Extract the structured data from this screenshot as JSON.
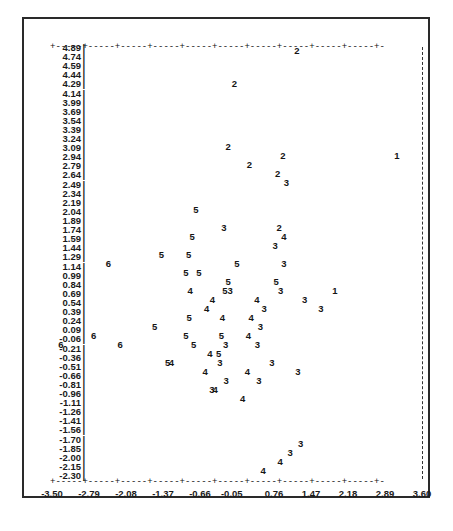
{
  "chart_data": {
    "type": "scatter",
    "title": "",
    "subtitle": "",
    "xlabel": "",
    "ylabel": "",
    "xlim": [
      -3.5,
      3.6
    ],
    "ylim": [
      -2.3,
      4.89
    ],
    "grid": false,
    "legend": "none",
    "marker_style": "cluster-number-glyph",
    "x_tick_labels": [
      "-3.50",
      "-2.79",
      "-2.08",
      "-1.37",
      "-0.66",
      "-0.05",
      "0.76",
      "1.47",
      "2.18",
      "2.89",
      "3.60"
    ],
    "x_tick_values": [
      -3.5,
      -2.79,
      -2.08,
      -1.37,
      -0.66,
      -0.05,
      0.76,
      1.47,
      2.18,
      2.89,
      3.6
    ],
    "y_tick_labels": [
      "4.89",
      "4.74",
      "4.59",
      "4.44",
      "4.29",
      "4.14",
      "3.99",
      "3.69",
      "3.54",
      "3.39",
      "3.24",
      "3.09",
      "2.94",
      "2.79",
      "2.64",
      "2.49",
      "2.34",
      "2.19",
      "2.04",
      "1.89",
      "1.74",
      "1.59",
      "1.44",
      "1.29",
      "1.14",
      "0.99",
      "0.84",
      "0.69",
      "0.54",
      "0.39",
      "0.24",
      "0.09",
      "-0.06",
      "-0.21",
      "-0.36",
      "-0.51",
      "-0.66",
      "-0.81",
      "-0.96",
      "-1.11",
      "-1.26",
      "-1.41",
      "-1.56",
      "-1.70",
      "-1.85",
      "-2.00",
      "-2.15",
      "-2.30"
    ],
    "y_tick_values": [
      4.89,
      4.74,
      4.59,
      4.44,
      4.29,
      4.14,
      3.99,
      3.69,
      3.54,
      3.39,
      3.24,
      3.09,
      2.94,
      2.79,
      2.64,
      2.49,
      2.34,
      2.19,
      2.04,
      1.89,
      1.74,
      1.59,
      1.44,
      1.29,
      1.14,
      0.99,
      0.84,
      0.69,
      0.54,
      0.39,
      0.24,
      0.09,
      -0.06,
      -0.21,
      -0.36,
      -0.51,
      -0.66,
      -0.81,
      -0.96,
      -1.11,
      -1.26,
      -1.41,
      -1.56,
      -1.7,
      -1.85,
      -2.0,
      -2.15,
      -2.3
    ],
    "groups": [
      "1",
      "2",
      "3",
      "4",
      "5",
      "6"
    ],
    "points": [
      {
        "label": "2",
        "x": 1.2,
        "y": 4.84
      },
      {
        "label": "2",
        "x": 0.0,
        "y": 4.29
      },
      {
        "label": "2",
        "x": -0.12,
        "y": 3.24
      },
      {
        "label": "2",
        "x": 0.29,
        "y": 2.94
      },
      {
        "label": "2",
        "x": 0.93,
        "y": 3.09
      },
      {
        "label": "2",
        "x": 0.83,
        "y": 2.79
      },
      {
        "label": "1",
        "x": 3.12,
        "y": 3.09
      },
      {
        "label": "3",
        "x": 1.0,
        "y": 2.64
      },
      {
        "label": "5",
        "x": -0.74,
        "y": 2.19
      },
      {
        "label": "3",
        "x": -0.2,
        "y": 1.89
      },
      {
        "label": "2",
        "x": 0.86,
        "y": 1.89
      },
      {
        "label": "5",
        "x": -0.81,
        "y": 1.74
      },
      {
        "label": "4",
        "x": 0.95,
        "y": 1.74
      },
      {
        "label": "3",
        "x": 0.78,
        "y": 1.59
      },
      {
        "label": "5",
        "x": -1.4,
        "y": 1.44
      },
      {
        "label": "5",
        "x": -0.88,
        "y": 1.44
      },
      {
        "label": "6",
        "x": -2.42,
        "y": 1.29
      },
      {
        "label": "5",
        "x": 0.05,
        "y": 1.29
      },
      {
        "label": "3",
        "x": 0.95,
        "y": 1.29
      },
      {
        "label": "5",
        "x": -0.93,
        "y": 1.14
      },
      {
        "label": "5",
        "x": -0.68,
        "y": 1.14
      },
      {
        "label": "5",
        "x": -0.12,
        "y": 0.99
      },
      {
        "label": "5",
        "x": 0.8,
        "y": 0.99
      },
      {
        "label": "4",
        "x": -0.85,
        "y": 0.84
      },
      {
        "label": "5",
        "x": -0.18,
        "y": 0.84
      },
      {
        "label": "3",
        "x": -0.08,
        "y": 0.84
      },
      {
        "label": "3",
        "x": 0.89,
        "y": 0.84
      },
      {
        "label": "1",
        "x": 1.93,
        "y": 0.84
      },
      {
        "label": "4",
        "x": -0.42,
        "y": 0.69
      },
      {
        "label": "4",
        "x": 0.43,
        "y": 0.69
      },
      {
        "label": "3",
        "x": 1.35,
        "y": 0.69
      },
      {
        "label": "4",
        "x": -0.53,
        "y": 0.54
      },
      {
        "label": "3",
        "x": 0.57,
        "y": 0.54
      },
      {
        "label": "3",
        "x": 1.66,
        "y": 0.54
      },
      {
        "label": "5",
        "x": -0.87,
        "y": 0.39
      },
      {
        "label": "4",
        "x": -0.23,
        "y": 0.39
      },
      {
        "label": "4",
        "x": 0.32,
        "y": 0.39
      },
      {
        "label": "5",
        "x": -1.53,
        "y": 0.24
      },
      {
        "label": "3",
        "x": 0.5,
        "y": 0.24
      },
      {
        "label": "6",
        "x": -2.7,
        "y": 0.09
      },
      {
        "label": "5",
        "x": -0.93,
        "y": 0.09
      },
      {
        "label": "5",
        "x": -0.25,
        "y": 0.09
      },
      {
        "label": "4",
        "x": 0.27,
        "y": 0.09
      },
      {
        "label": "6",
        "x": -3.33,
        "y": -0.06
      },
      {
        "label": "6",
        "x": -2.19,
        "y": -0.06
      },
      {
        "label": "5",
        "x": -0.78,
        "y": -0.06
      },
      {
        "label": "3",
        "x": -0.17,
        "y": -0.06
      },
      {
        "label": "3",
        "x": 0.44,
        "y": -0.06
      },
      {
        "label": "4",
        "x": -0.47,
        "y": -0.21
      },
      {
        "label": "5",
        "x": -0.3,
        "y": -0.21
      },
      {
        "label": "5",
        "x": -1.28,
        "y": -0.36
      },
      {
        "label": "4",
        "x": -1.21,
        "y": -0.36
      },
      {
        "label": "3",
        "x": -0.28,
        "y": -0.36
      },
      {
        "label": "3",
        "x": 0.72,
        "y": -0.36
      },
      {
        "label": "4",
        "x": -0.56,
        "y": -0.51
      },
      {
        "label": "4",
        "x": 0.25,
        "y": -0.51
      },
      {
        "label": "3",
        "x": 1.22,
        "y": -0.51
      },
      {
        "label": "3",
        "x": -0.16,
        "y": -0.66
      },
      {
        "label": "3",
        "x": 0.47,
        "y": -0.66
      },
      {
        "label": "3",
        "x": -0.43,
        "y": -0.81
      },
      {
        "label": "4",
        "x": -0.37,
        "y": -0.81
      },
      {
        "label": "4",
        "x": 0.16,
        "y": -0.96
      },
      {
        "label": "3",
        "x": 1.27,
        "y": -1.7
      },
      {
        "label": "3",
        "x": 1.07,
        "y": -1.85
      },
      {
        "label": "4",
        "x": 0.88,
        "y": -2.0
      },
      {
        "label": "4",
        "x": 0.55,
        "y": -2.15
      }
    ]
  },
  "axes": {
    "top_axis_glyph": "+-----+-----+-----+-----+-----+-----+-----+-----+-----+-----+-",
    "bottom_axis_glyph": "+-----+-----+-----+-----+-----+-----+-----+-----+-----+-----+-",
    "y_axis_tick_mark": "|"
  }
}
